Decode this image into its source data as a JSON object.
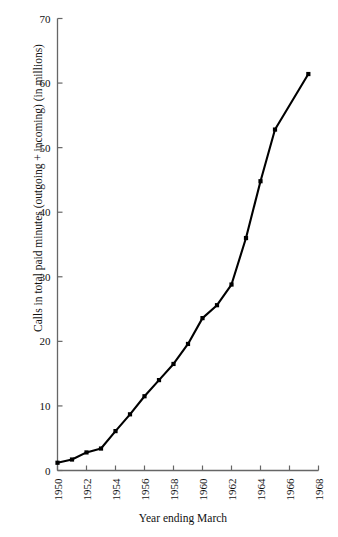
{
  "chart_data": {
    "type": "line",
    "title": "",
    "subtitle": "",
    "xlabel": "Year ending March",
    "ylabel": "Calls in total paid minutes (outgoing + incoming) (in millions)",
    "xlim": [
      1950,
      1968
    ],
    "ylim": [
      0,
      70
    ],
    "xticks": [
      1950,
      1952,
      1954,
      1956,
      1958,
      1960,
      1962,
      1964,
      1966,
      1968
    ],
    "xticklabels": [
      "1950",
      "1952",
      "1954",
      "1956",
      "1958",
      "1960",
      "1962",
      "1964",
      "1966",
      "1968"
    ],
    "xtick_rotation": 90,
    "yticks": [
      0,
      10,
      20,
      30,
      40,
      50,
      60,
      70
    ],
    "yticklabels": [
      "0",
      "10",
      "20",
      "30",
      "40",
      "50",
      "60",
      "70"
    ],
    "grid": false,
    "legend": null,
    "legend_position": "none",
    "line_color": "#000000",
    "marker": "square",
    "marker_color": "#000000",
    "x": [
      1950,
      1951,
      1952,
      1953,
      1954,
      1955,
      1956,
      1957,
      1958,
      1959,
      1960,
      1961,
      1962,
      1963,
      1964,
      1965,
      1967.3
    ],
    "series": [
      {
        "name": "Calls in total paid minutes",
        "values": [
          1.2,
          1.7,
          2.8,
          3.4,
          6.1,
          8.7,
          11.5,
          14.0,
          16.5,
          19.6,
          23.6,
          25.6,
          28.8,
          36.0,
          44.8,
          52.8,
          61.4
        ]
      }
    ],
    "annotations": []
  }
}
